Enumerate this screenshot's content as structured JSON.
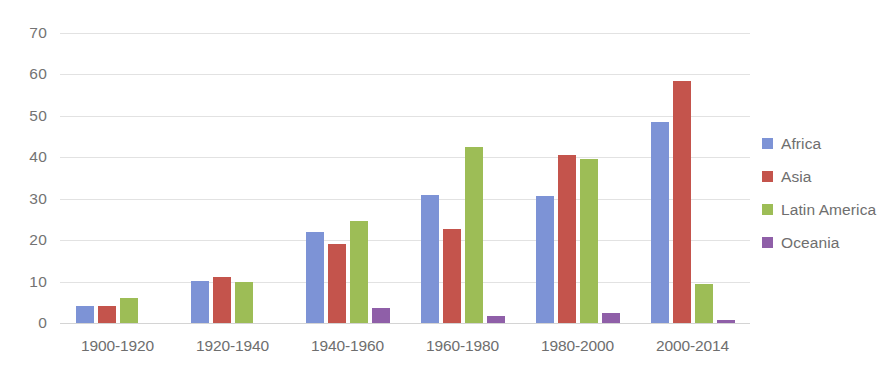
{
  "chart_data": {
    "type": "bar",
    "title": "",
    "subtitle": "",
    "xlabel": "",
    "ylabel": "",
    "categories": [
      "1900-1920",
      "1920-1940",
      "1940-1960",
      "1960-1980",
      "1980-2000",
      "2000-2014"
    ],
    "series": [
      {
        "name": "Africa",
        "color": "#7d93d6",
        "values": [
          4.0,
          10.2,
          22.0,
          30.8,
          30.7,
          48.5
        ]
      },
      {
        "name": "Asia",
        "color": "#c4544c",
        "values": [
          4.1,
          11.0,
          19.0,
          22.8,
          40.6,
          58.3
        ]
      },
      {
        "name": "Latin America",
        "color": "#9dbd56",
        "values": [
          6.0,
          10.0,
          24.6,
          42.6,
          39.6,
          9.3
        ]
      },
      {
        "name": "Oceania",
        "color": "#8f5fa8",
        "values": [
          0,
          0,
          3.7,
          1.8,
          2.5,
          0.7
        ]
      }
    ],
    "y_ticks": [
      0,
      10,
      20,
      30,
      40,
      50,
      60,
      70
    ],
    "ylim": [
      0,
      70
    ],
    "grid": true,
    "legend_position": "right"
  }
}
